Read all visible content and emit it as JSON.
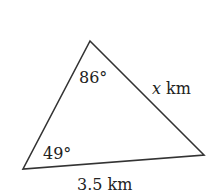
{
  "diagram": {
    "type": "triangle",
    "vertices": {
      "top": [
        90,
        41
      ],
      "bottom_left": [
        23,
        169
      ],
      "bottom_right": [
        204,
        155
      ]
    },
    "stroke_color": "#333333",
    "angles": {
      "top": "86°",
      "bottom_left": "49°"
    },
    "sides": {
      "right_variable": "x",
      "right_unit": " km",
      "bottom": "3.5 km"
    }
  }
}
